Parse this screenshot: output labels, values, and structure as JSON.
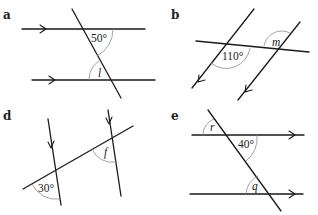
{
  "panels": [
    {
      "id": "a",
      "label": "a",
      "given_angle": "50°",
      "unknown": "l"
    },
    {
      "id": "b",
      "label": "b",
      "given_angle": "110°",
      "unknown": "m"
    },
    {
      "id": "d",
      "label": "d",
      "given_angle": "30°",
      "unknown": "f"
    },
    {
      "id": "e",
      "label": "e",
      "given_angle": "40°",
      "unknown": "q",
      "unknown2": "r"
    }
  ]
}
